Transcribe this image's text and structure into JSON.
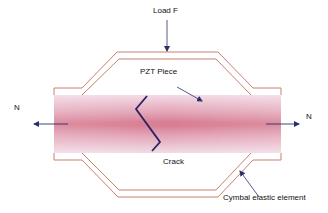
{
  "labels": {
    "load": "Load F",
    "pzt": "PZT Piece",
    "crack": "Crack",
    "cymbal": "Cymbal elastic element",
    "n_left": "N",
    "n_right": "N"
  },
  "colors": {
    "cymbal_line": "#c9806e",
    "bar_edge": "#f3dde6",
    "bar_mid": "#d98097",
    "bar_center": "#c9506a",
    "center_line": "#e98a80",
    "arrow": "#2b2f6e",
    "crack": "#2a2160",
    "text": "#111111"
  }
}
